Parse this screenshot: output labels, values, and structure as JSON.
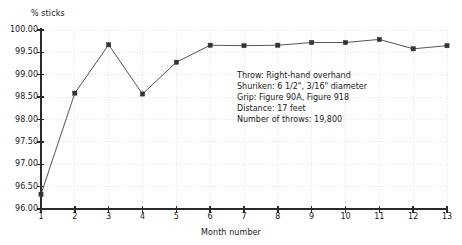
{
  "chart_data": {
    "type": "line",
    "title": "",
    "xlabel": "Month number",
    "ylabel": "% sticks",
    "x": [
      1,
      2,
      3,
      4,
      5,
      6,
      7,
      8,
      9,
      10,
      11,
      12,
      13
    ],
    "values": [
      96.33,
      98.59,
      99.67,
      98.57,
      99.28,
      99.66,
      99.65,
      99.66,
      99.72,
      99.72,
      99.79,
      99.58,
      99.65
    ],
    "series": [
      {
        "name": "% sticks",
        "values": [
          96.33,
          98.59,
          99.67,
          98.57,
          99.28,
          99.66,
          99.65,
          99.66,
          99.72,
          99.72,
          99.79,
          99.58,
          99.65
        ]
      }
    ],
    "xlim": [
      1,
      13
    ],
    "ylim": [
      96.0,
      100.0
    ],
    "ytick_labels": [
      "100.00",
      "99.50",
      "99.00",
      "98.50",
      "98.00",
      "97.50",
      "97.00",
      "96.50",
      "96.00"
    ],
    "ytick_values": [
      100.0,
      99.5,
      99.0,
      98.5,
      98.0,
      97.5,
      97.0,
      96.5,
      96.0
    ],
    "xtick_labels": [
      "1",
      "2",
      "3",
      "4",
      "5",
      "6",
      "7",
      "8",
      "9",
      "10",
      "11",
      "12",
      "13"
    ],
    "xtick_values": [
      1,
      2,
      3,
      4,
      5,
      6,
      7,
      8,
      9,
      10,
      11,
      12,
      13
    ],
    "grid": true,
    "legend": "none",
    "marker": "square",
    "line_color": "#555555",
    "marker_color": "#333333",
    "grid_color": "#e2e2e2",
    "axis_color": "#2b2b2b",
    "annotation_lines": [
      "Throw: Right-hand overhand",
      "Shuriken: 6 1/2\", 3/16\" diameter",
      "Grip: Figure 90A, Figure 918",
      "Distance: 17 feet",
      "Number of throws: 19,800"
    ]
  }
}
